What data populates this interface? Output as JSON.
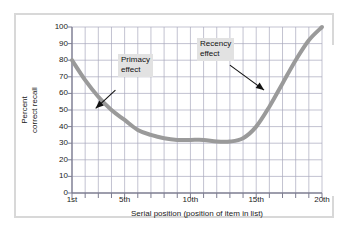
{
  "chart_data": {
    "type": "line",
    "title": "",
    "subtitle": "",
    "xlabel": "Serial position (position of item in list)",
    "ylabel": "Percent correct recall",
    "ylabel_line1": "Percent",
    "ylabel_line2": "correct recall",
    "xlim": [
      1,
      20
    ],
    "ylim": [
      0,
      100
    ],
    "grid": true,
    "legend": "none",
    "y_ticks": [
      0,
      10,
      20,
      30,
      40,
      50,
      60,
      70,
      80,
      90,
      100
    ],
    "y_tick_labels": [
      "0",
      "10",
      "20",
      "30",
      "40",
      "50",
      "60",
      "70",
      "80",
      "90",
      "100"
    ],
    "x_ticks": [
      1,
      5,
      10,
      15,
      20
    ],
    "x_tick_labels": [
      "1st",
      "5th",
      "10th",
      "15th",
      "20th"
    ],
    "x_minor_ticks": [
      1,
      2,
      3,
      4,
      5,
      6,
      7,
      8,
      9,
      10,
      11,
      12,
      13,
      14,
      15,
      16,
      17,
      18,
      19,
      20
    ],
    "series": [
      {
        "name": "Percent correct recall",
        "color": "#9a9a9a",
        "x": [
          1,
          2,
          3,
          4,
          5,
          6,
          7,
          8,
          9,
          10,
          11,
          12,
          13,
          14,
          15,
          16,
          17,
          18,
          19,
          20
        ],
        "values": [
          80,
          68,
          58,
          50,
          44,
          38,
          35,
          33,
          32,
          32,
          32,
          31,
          31,
          33,
          40,
          52,
          66,
          80,
          92,
          100
        ]
      }
    ],
    "annotations": [
      {
        "label": "Primacy effect",
        "label_line1": "Primacy",
        "label_line2": "effect",
        "arrow_from": [
          4.3,
          62
        ],
        "arrow_to": [
          2.8,
          51
        ]
      },
      {
        "label": "Recency effect",
        "label_line1": "Recency",
        "label_line2": "effect",
        "arrow_from": [
          13.0,
          77
        ],
        "arrow_to": [
          15.6,
          62
        ]
      }
    ]
  },
  "figure": {
    "axis_color": "#7d7d91",
    "grid_color": "#a9a9bd",
    "curve_color": "#9a9a9a",
    "frame_color": "#d8d8d8",
    "annotation_bg": "#e2e2e2",
    "text_color": "#1a1a1a"
  }
}
